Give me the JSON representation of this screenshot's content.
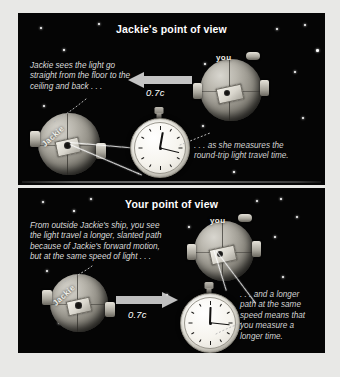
{
  "figure": {
    "name": "relativity-time-dilation-figure",
    "background_color": "#e8e8e6",
    "panel_color": "#050505"
  },
  "panels": [
    {
      "id": "jackies-point-of-view",
      "title": "Jackie's point of view",
      "captions": {
        "left": "Jackie sees the light go\nstraight from the floor to the\nceiling and back . . .",
        "right": ". . . as she measures the\nround-trip light travel time."
      },
      "speed_label": "0.7c",
      "arrow_direction": "left",
      "ships": [
        {
          "label": "you",
          "role": "observer-ship"
        },
        {
          "label": "Jackie",
          "role": "jackie-ship"
        }
      ],
      "stopwatch": {
        "name": "stopwatch-short-time",
        "hour_hand_angle": 10,
        "minute_hand_angle": 104,
        "tick_labels": [
          "60",
          "5",
          "10",
          "15",
          "20",
          "25",
          "30",
          "35",
          "40",
          "45",
          "50",
          "55"
        ]
      },
      "light_path": "vertical-straight"
    },
    {
      "id": "your-point-of-view",
      "title": "Your point of view",
      "captions": {
        "left": "From outside Jackie's ship, you see\nthe light travel a longer, slanted path\nbecause of Jackie's forward motion,\nbut at the same speed of light . . .",
        "right": ". . . and a longer\npath at the same\nspeed means that\nyou measure a\nlonger time."
      },
      "speed_label": "0.7c",
      "arrow_direction": "right",
      "ships": [
        {
          "label": "you",
          "role": "observer-ship"
        },
        {
          "label": "Jackie",
          "role": "jackie-ship"
        }
      ],
      "stopwatch": {
        "name": "stopwatch-long-time",
        "hour_hand_angle": 2,
        "minute_hand_angle": 96,
        "tick_labels": [
          "60",
          "5",
          "10",
          "15",
          "20",
          "25",
          "30",
          "35",
          "40",
          "45",
          "50",
          "55"
        ]
      },
      "light_path": "slanted-longer"
    }
  ],
  "colors": {
    "panel_background": "#050505",
    "title_text": "#ffffff",
    "caption_text": "#d9d9d9",
    "speed_text": "#ffffff",
    "light_line": "#ffffff",
    "divider": "#6e6e6e"
  }
}
